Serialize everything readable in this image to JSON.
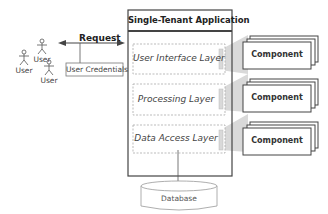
{
  "app": {
    "title": "Single-Tenant Application"
  },
  "layers": [
    {
      "label": "User Interface Layer"
    },
    {
      "label": "Processing Layer"
    },
    {
      "label": "Data Access Layer"
    }
  ],
  "components": [
    {
      "label": "Component"
    },
    {
      "label": "Component"
    },
    {
      "label": "Component"
    }
  ],
  "users": [
    {
      "label": "User"
    },
    {
      "label": "User"
    },
    {
      "label": "User"
    }
  ],
  "request": {
    "label": "Request",
    "credentials": "User Credentials"
  },
  "database": {
    "label": "Database"
  },
  "colors": {
    "stroke": "#444444",
    "dashed": "#aaaaaa",
    "funnel": "#d4d4d4"
  }
}
